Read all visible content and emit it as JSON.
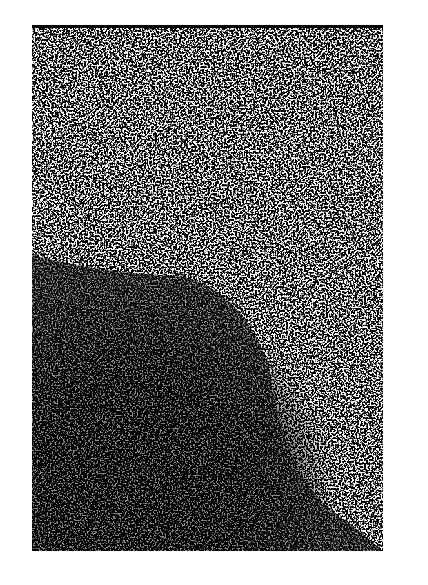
{
  "image": {
    "description": "High-contrast black and white grainy halftone texture with a large dark mass occupying the lower-left region and a dark patch near the upper-left edge",
    "colors": {
      "dark": "#000000",
      "light": "#ffffff"
    }
  }
}
